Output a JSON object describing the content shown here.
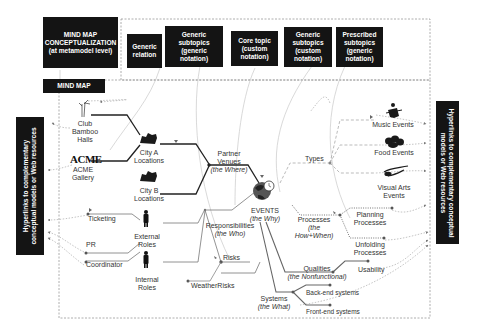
{
  "legend": {
    "conceptualization": "MIND MAP CONCEPTUALIZATION (at metamodel level)",
    "conceptualization_lines": [
      "MIND MAP",
      "CONCEPTUALIZATION",
      "(at metamodel level)"
    ],
    "generic_relation": [
      "Generic",
      "relation"
    ],
    "generic_subtopics_generic": [
      "Generic",
      "subtopics",
      "(generic",
      "notation)"
    ],
    "core_topic": [
      "Core topic",
      "(custom",
      "notation)"
    ],
    "generic_subtopics_custom": [
      "Generic",
      "subtopics",
      "(custom",
      "notation)"
    ],
    "prescribed_subtopics": [
      "Prescribed",
      "subtopics",
      "(generic",
      "notation)"
    ]
  },
  "mind_map_label": "MIND MAP",
  "hyperlinks_left": [
    "Hyperlinks to complementary",
    "conceptual models or Web resources"
  ],
  "hyperlinks_right": [
    "Hyperlinks to complementary conceptual",
    "models or Web resources"
  ],
  "core_topic": {
    "label": "EVENTS",
    "sub": "(the Why)",
    "icon": "globe-clock-icon"
  },
  "nodes": {
    "partner_venues": {
      "label": "Partner Venues",
      "sub": "(the Where)"
    },
    "city_a": {
      "label": [
        "City A",
        "Locations"
      ],
      "icon": "city-icon"
    },
    "city_b": {
      "label": [
        "City B",
        "Locations"
      ],
      "icon": "city-icon"
    },
    "club_bamboo": {
      "label": [
        "Club",
        "Bamboo",
        "Halls"
      ],
      "icon": "bamboo-icon"
    },
    "acme": {
      "label": [
        "ACME",
        "Gallery"
      ],
      "logo": "ACME",
      "icon": "acme-logo-icon"
    },
    "responsibilities": {
      "label": "Responsibilities",
      "sub": "(the Who)"
    },
    "external_roles": {
      "label": [
        "External",
        "Roles"
      ],
      "icon": "person-icon"
    },
    "internal_roles": {
      "label": [
        "Internal",
        "Roles"
      ],
      "icon": "person-icon"
    },
    "ticketing": {
      "label": "Ticketing"
    },
    "pr": {
      "label": "PR"
    },
    "coordinator": {
      "label": "Coordinator"
    },
    "risks": {
      "label": "Risks"
    },
    "weather_risks": {
      "label": "WeatherRisks"
    },
    "types": {
      "label": "Types"
    },
    "music_events": {
      "label": "Music Events",
      "icon": "guitarist-icon"
    },
    "food_events": {
      "label": "Food Events",
      "icon": "food-icon"
    },
    "visual_arts": {
      "label": [
        "Visual Arts",
        "Events"
      ],
      "icon": "brush-icon"
    },
    "processes": {
      "label": "Processes",
      "sub": [
        "(the",
        "How+When)"
      ]
    },
    "planning": {
      "label": [
        "Planning",
        "Processes"
      ]
    },
    "unfolding": {
      "label": [
        "Unfolding",
        "Processes"
      ]
    },
    "qualities": {
      "label": "Qualities",
      "sub": "(the Nonfunctional)"
    },
    "usability": {
      "label": "Usability"
    },
    "systems": {
      "label": "Systems",
      "sub": "(the What)"
    },
    "backend": {
      "label": "Back-end systems"
    },
    "frontend": {
      "label": "Front-end systems"
    }
  }
}
